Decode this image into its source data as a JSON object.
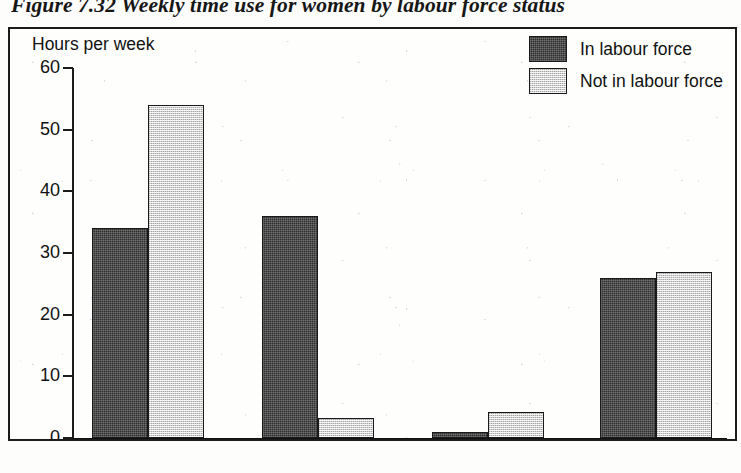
{
  "caption": "Figure 7.32 Weekly time use for women by labour force status",
  "axis_title": "Hours per week",
  "legend": [
    {
      "label": "In labour force",
      "swatch": "dark"
    },
    {
      "label": "Not in labour force",
      "swatch": "light"
    }
  ],
  "colors": {
    "series_dark": "#2e2e2e",
    "series_light": "#d2d2d2",
    "axis": "#1c1c1c",
    "frame": "#1b1b1b",
    "text": "#111111",
    "paper": "#fefefd"
  },
  "chart_data": {
    "type": "bar",
    "title": "Figure 7.32 Weekly time use for women by labour force status",
    "xlabel": "",
    "ylabel": "Hours per week",
    "ylim": [
      0,
      60
    ],
    "yticks": [
      0,
      10,
      20,
      30,
      40,
      50,
      60
    ],
    "grid": false,
    "legend_position": "top-right",
    "categories": [
      "Hosework",
      "Paid work",
      "Studying",
      "Relaxing/other"
    ],
    "series": [
      {
        "name": "In labour force",
        "values": [
          34,
          36,
          1,
          26
        ]
      },
      {
        "name": "Not in labour force",
        "values": [
          54,
          3.3,
          4.2,
          27
        ]
      }
    ]
  }
}
